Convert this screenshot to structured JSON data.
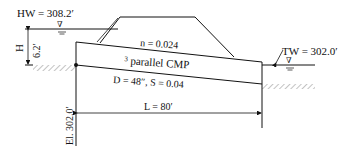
{
  "diagram": {
    "headwater_label": "HW = 308.2′",
    "tailwater_label": "TW = 302.0′",
    "h_label": "H",
    "h_value": "6.2′",
    "roughness_label": "n = 0.024",
    "culvert_label_sup": "3",
    "culvert_label": " parallel CMP",
    "dims_label": "D = 48″, S = 0.04",
    "length_label": "L = 80′",
    "elevation_label": "El. 302.0′",
    "water_symbol": "∇"
  }
}
